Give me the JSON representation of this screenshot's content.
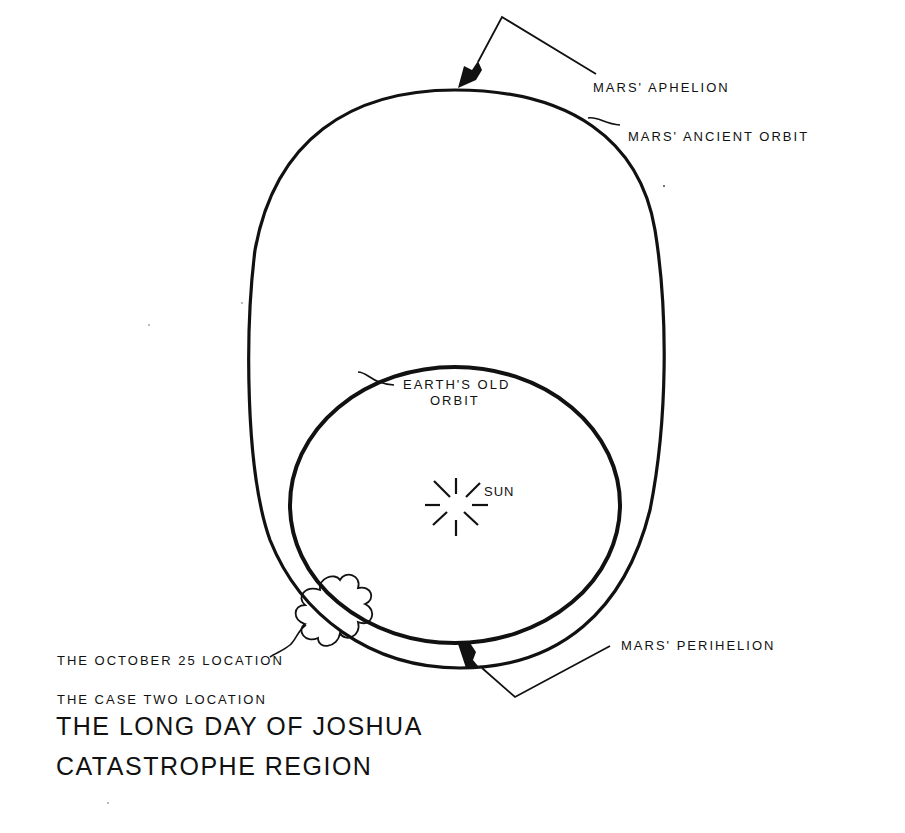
{
  "diagram": {
    "title_lines": [
      "THE LONG DAY OF JOSHUA",
      "CATASTROPHE REGION"
    ],
    "subtitle": "THE CASE TWO LOCATION",
    "labels": {
      "mars_aphelion": "MARS' APHELION",
      "mars_ancient_orbit": "MARS' ANCIENT  ORBIT",
      "earth_old_orbit_line1": "EARTH'S  OLD",
      "earth_old_orbit_line2": "ORBIT",
      "sun": "SUN",
      "mars_perihelion": "MARS'  PERIHELION",
      "october_25_location": "THE OCTOBER 25 LOCATION"
    },
    "elements": {
      "mars_orbit": "egg-shaped ancient Mars orbit",
      "earth_orbit": "near-circular old Earth orbit",
      "sun": "sun-burst symbol",
      "catastrophe_region": "cloud symbol at orbit crossing",
      "aphelion_arrow": "arrow pointing to top of Mars orbit",
      "perihelion_arrow": "arrow pointing to bottom of Mars orbit"
    },
    "stroke_color": "#111111",
    "background_color": "#ffffff"
  }
}
